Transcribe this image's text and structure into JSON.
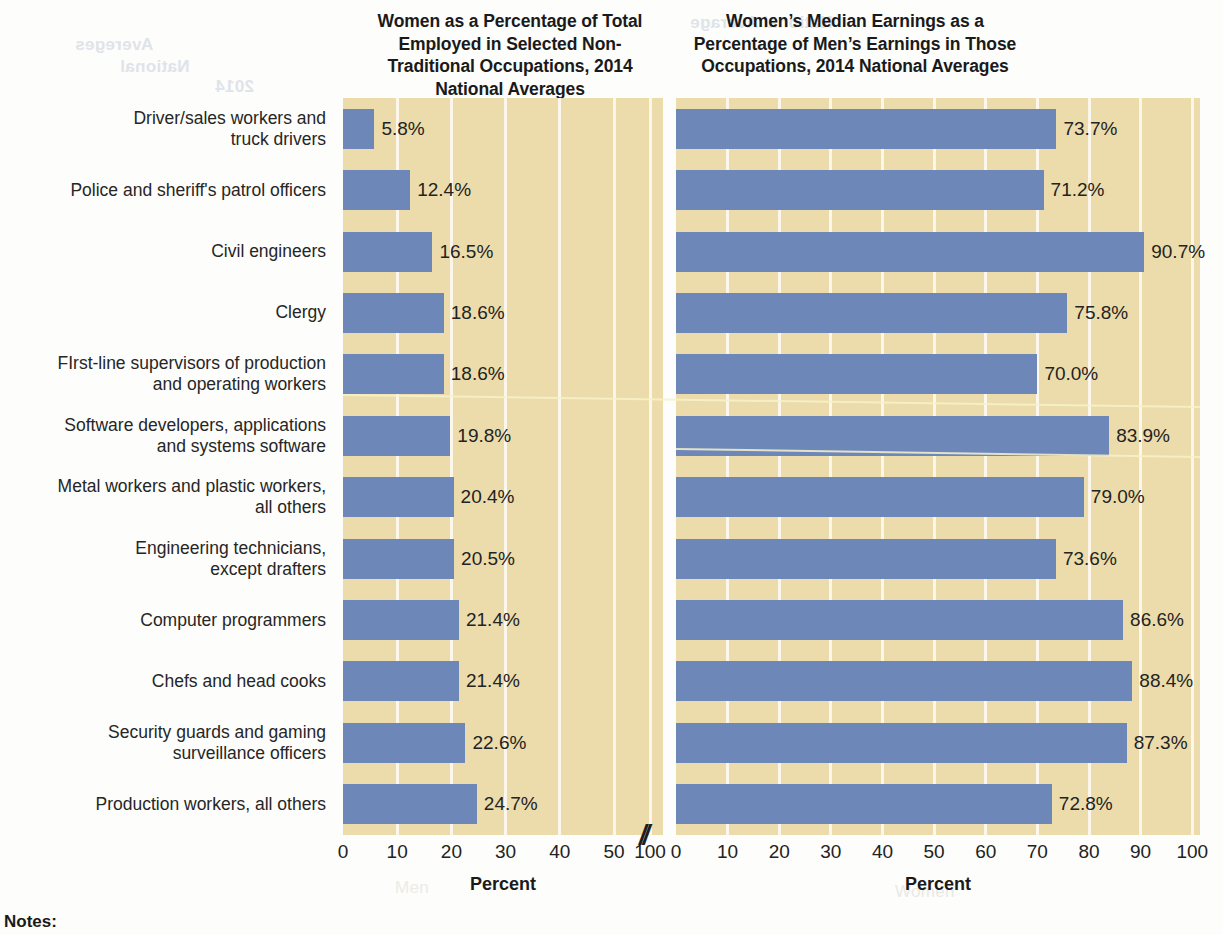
{
  "titles": {
    "left": "Women as a Percentage of Total Employed in Selected Non-Traditional Occupations, 2014 National Averages",
    "right": "Women’s Median Earnings as a Percentage of Men’s Earnings in Those Occupations, 2014 National Averages"
  },
  "axis": {
    "left_label": "Percent",
    "right_label": "Percent",
    "left_ticks": [
      "0",
      "10",
      "20",
      "30",
      "40",
      "50",
      "100"
    ],
    "right_ticks": [
      "0",
      "10",
      "20",
      "30",
      "40",
      "50",
      "60",
      "70",
      "80",
      "90",
      "100"
    ],
    "break_mark": "//"
  },
  "footer": {
    "notes_label": "Notes:"
  },
  "bleed_text": {
    "b1": "Avereges",
    "b2": "National",
    "b3": "2014",
    "b4": "National Average",
    "b5": "Women",
    "b6": "Women",
    "b7": "Men"
  },
  "colors": {
    "bar": "#6d87b9",
    "panel_background": "#ecdcab",
    "gridline": "#fdf9ef",
    "text": "#1a1a1a"
  },
  "chart_data": [
    {
      "type": "bar",
      "orientation": "horizontal",
      "title": "Women as a Percentage of Total Employed in Selected Non-Traditional Occupations, 2014 National Averages",
      "xlabel": "Percent",
      "ylabel": "",
      "xlim": [
        0,
        50
      ],
      "axis_break": true,
      "axis_break_after": 50,
      "grid": true,
      "legend": "none",
      "categories": [
        "Driver/sales workers and truck drivers",
        "Police and sheriff's patrol officers",
        "Civil engineers",
        "Clergy",
        "FIrst-line supervisors of production and operating workers",
        "Software developers, applications and systems software",
        "Metal workers and plastic workers, all others",
        "Engineering technicians, except drafters",
        "Computer programmers",
        "Chefs and head cooks",
        "Security guards and gaming surveillance officers",
        "Production workers, all others"
      ],
      "values": [
        5.8,
        12.4,
        16.5,
        18.6,
        18.6,
        19.8,
        20.4,
        20.5,
        21.4,
        21.4,
        22.6,
        24.7
      ],
      "data_labels": [
        "5.8%",
        "12.4%",
        "16.5%",
        "18.6%",
        "18.6%",
        "19.8%",
        "20.4%",
        "20.5%",
        "21.4%",
        "21.4%",
        "22.6%",
        "24.7%"
      ]
    },
    {
      "type": "bar",
      "orientation": "horizontal",
      "title": "Women’s Median Earnings as a Percentage of Men’s Earnings in Those Occupations, 2014 National Averages",
      "xlabel": "Percent",
      "ylabel": "",
      "xlim": [
        0,
        100
      ],
      "axis_break": false,
      "grid": true,
      "legend": "none",
      "categories": [
        "Driver/sales workers and truck drivers",
        "Police and sheriff's patrol officers",
        "Civil engineers",
        "Clergy",
        "FIrst-line supervisors of production and operating workers",
        "Software developers, applications and systems software",
        "Metal workers and plastic workers, all others",
        "Engineering technicians, except drafters",
        "Computer programmers",
        "Chefs and head cooks",
        "Security guards and gaming surveillance officers",
        "Production workers, all others"
      ],
      "values": [
        73.7,
        71.2,
        90.7,
        75.8,
        70.0,
        83.9,
        79.0,
        73.6,
        86.6,
        88.4,
        87.3,
        72.8
      ],
      "data_labels": [
        "73.7%",
        "71.2%",
        "90.7%",
        "75.8%",
        "70.0%",
        "83.9%",
        "79.0%",
        "73.6%",
        "86.6%",
        "88.4%",
        "87.3%",
        "72.8%"
      ]
    }
  ],
  "category_label_lines": [
    [
      "Driver/sales workers and",
      "truck drivers"
    ],
    [
      "Police and sheriff's patrol officers"
    ],
    [
      "Civil engineers"
    ],
    [
      "Clergy"
    ],
    [
      "FIrst-line supervisors of production",
      "and operating workers"
    ],
    [
      "Software developers, applications",
      "and systems software"
    ],
    [
      "Metal workers and plastic workers,",
      "all others"
    ],
    [
      "Engineering technicians,",
      "except drafters"
    ],
    [
      "Computer programmers"
    ],
    [
      "Chefs and head cooks"
    ],
    [
      "Security guards and gaming",
      "surveillance officers"
    ],
    [
      "Production workers, all others"
    ]
  ]
}
